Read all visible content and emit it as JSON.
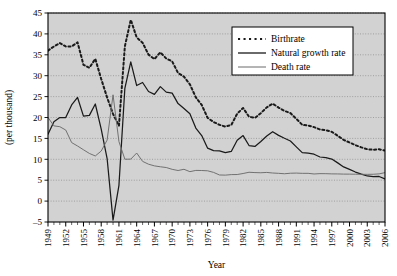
{
  "chart_data": {
    "type": "line",
    "title": "",
    "xlabel": "Year",
    "ylabel": "(per thousand)",
    "xlim": [
      1949,
      2006
    ],
    "ylim": [
      -5,
      45
    ],
    "yticks": [
      -5,
      0,
      5,
      10,
      15,
      20,
      25,
      30,
      35,
      40,
      45
    ],
    "xticks": [
      1949,
      1952,
      1955,
      1958,
      1961,
      1964,
      1967,
      1970,
      1973,
      1976,
      1979,
      1982,
      1985,
      1988,
      1991,
      1994,
      1997,
      2000,
      2003,
      2006
    ],
    "grid": "horizontal-dotted",
    "legend_position": "top-right",
    "plot_background": "#d2d2d2",
    "x": [
      1949,
      1950,
      1951,
      1952,
      1953,
      1954,
      1955,
      1956,
      1957,
      1958,
      1959,
      1960,
      1961,
      1962,
      1963,
      1964,
      1965,
      1966,
      1967,
      1968,
      1969,
      1970,
      1971,
      1972,
      1973,
      1974,
      1975,
      1976,
      1977,
      1978,
      1979,
      1980,
      1981,
      1982,
      1983,
      1984,
      1985,
      1986,
      1987,
      1988,
      1989,
      1990,
      1991,
      1992,
      1993,
      1994,
      1995,
      1996,
      1997,
      1998,
      1999,
      2000,
      2001,
      2002,
      2003,
      2004,
      2005,
      2006
    ],
    "series": [
      {
        "name": "Birthrate",
        "style": "dotted",
        "color": "#1a1a1a",
        "values": [
          36.0,
          37.0,
          37.8,
          37.0,
          37.0,
          37.97,
          32.6,
          31.9,
          34.03,
          29.22,
          24.78,
          20.86,
          18.02,
          37.01,
          43.37,
          39.14,
          37.88,
          35.05,
          33.96,
          35.59,
          34.11,
          33.43,
          30.65,
          29.77,
          27.93,
          24.82,
          23.01,
          19.91,
          18.93,
          18.25,
          17.82,
          18.21,
          20.91,
          22.28,
          20.19,
          19.9,
          21.04,
          22.43,
          23.33,
          22.37,
          21.58,
          21.06,
          19.68,
          18.24,
          18.09,
          17.7,
          17.12,
          16.98,
          16.57,
          15.64,
          14.64,
          14.03,
          13.38,
          12.86,
          12.41,
          12.29,
          12.4,
          12.09
        ]
      },
      {
        "name": "Natural growth rate",
        "style": "solid-bold",
        "color": "#1a1a1a",
        "values": [
          16.0,
          19.0,
          20.0,
          20.0,
          23.0,
          24.79,
          20.32,
          20.5,
          23.23,
          17.24,
          10.19,
          -4.57,
          3.78,
          26.99,
          33.33,
          27.64,
          28.38,
          26.22,
          25.53,
          27.38,
          26.08,
          25.83,
          23.33,
          22.16,
          20.89,
          17.48,
          15.69,
          12.66,
          12.06,
          12.0,
          11.61,
          11.87,
          14.55,
          15.68,
          13.29,
          13.08,
          14.26,
          15.57,
          16.61,
          15.73,
          15.04,
          14.39,
          12.98,
          11.6,
          11.45,
          11.21,
          10.55,
          10.42,
          10.06,
          9.14,
          8.18,
          7.58,
          6.95,
          6.45,
          6.01,
          5.87,
          5.89,
          5.28
        ]
      },
      {
        "name": "Death rate",
        "style": "solid-thin",
        "color": "#6b6b6b",
        "values": [
          20.0,
          18.0,
          17.8,
          17.0,
          14.0,
          13.18,
          12.28,
          11.4,
          10.8,
          11.98,
          14.59,
          25.43,
          14.24,
          10.02,
          10.04,
          11.5,
          9.5,
          8.83,
          8.43,
          8.21,
          8.03,
          7.6,
          7.32,
          7.61,
          7.04,
          7.34,
          7.32,
          7.25,
          6.87,
          6.25,
          6.21,
          6.34,
          6.36,
          6.6,
          6.9,
          6.82,
          6.78,
          6.86,
          6.72,
          6.64,
          6.54,
          6.67,
          6.7,
          6.64,
          6.64,
          6.49,
          6.57,
          6.56,
          6.51,
          6.5,
          6.46,
          6.45,
          6.43,
          6.41,
          6.4,
          6.42,
          6.51,
          6.81
        ]
      }
    ]
  },
  "axes": {
    "y_title": "(per thousand)",
    "x_title": "Year",
    "y_tick_labels": [
      "45",
      "40",
      "35",
      "30",
      "25",
      "20",
      "15",
      "10",
      "5",
      "0",
      "-5"
    ],
    "x_tick_labels": [
      "1949",
      "1952",
      "1955",
      "1958",
      "1961",
      "1964",
      "1967",
      "1970",
      "1973",
      "1976",
      "1979",
      "1982",
      "1985",
      "1988",
      "1991",
      "1994",
      "1997",
      "2000",
      "2003",
      "2006"
    ]
  },
  "legend": {
    "items": [
      {
        "label": "Birthrate",
        "style": "dotted"
      },
      {
        "label": "Natural growth rate",
        "style": "solid-bold"
      },
      {
        "label": "Death rate",
        "style": "solid-thin"
      }
    ]
  }
}
